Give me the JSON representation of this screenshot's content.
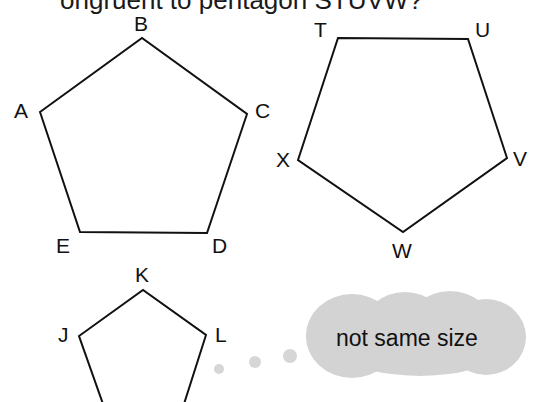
{
  "header": {
    "partial_text": "ongruent to pentagon STUVW?"
  },
  "pentagons": [
    {
      "name": "ABCDE",
      "vertices": [
        {
          "label": "A",
          "x": 40,
          "y": 112
        },
        {
          "label": "B",
          "x": 142,
          "y": 38
        },
        {
          "label": "C",
          "x": 247,
          "y": 114
        },
        {
          "label": "D",
          "x": 207,
          "y": 233
        },
        {
          "label": "E",
          "x": 80,
          "y": 232
        }
      ]
    },
    {
      "name": "TUVWX",
      "vertices": [
        {
          "label": "T",
          "x": 338,
          "y": 38
        },
        {
          "label": "U",
          "x": 468,
          "y": 39
        },
        {
          "label": "V",
          "x": 507,
          "y": 158
        },
        {
          "label": "W",
          "x": 403,
          "y": 232
        },
        {
          "label": "X",
          "x": 298,
          "y": 160
        }
      ]
    },
    {
      "name": "JKL",
      "vertices": [
        {
          "label": "J",
          "x": 79,
          "y": 336
        },
        {
          "label": "K",
          "x": 143,
          "y": 290
        },
        {
          "label": "L",
          "x": 206,
          "y": 335
        }
      ]
    }
  ],
  "labels": {
    "A": "A",
    "B": "B",
    "C": "C",
    "D": "D",
    "E": "E",
    "T": "T",
    "U": "U",
    "V": "V",
    "W": "W",
    "X": "X",
    "J": "J",
    "K": "K",
    "L": "L"
  },
  "thought_bubble": {
    "text": "not same size",
    "color": "#d3d3d3"
  }
}
